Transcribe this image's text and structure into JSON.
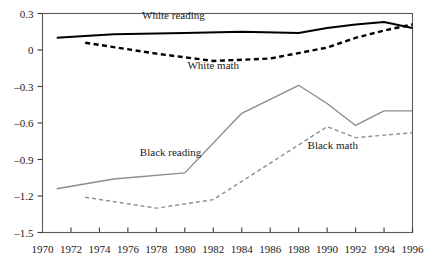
{
  "chart_data": {
    "type": "line",
    "title": "",
    "xlabel": "",
    "ylabel": "",
    "xlim": [
      1970,
      1996
    ],
    "ylim": [
      -1.5,
      0.3
    ],
    "grid": false,
    "legend_position": "inline-annotations",
    "x_ticks": [
      1970,
      1972,
      1974,
      1976,
      1978,
      1980,
      1982,
      1984,
      1986,
      1988,
      1990,
      1992,
      1994,
      1996
    ],
    "x_tick_labels": [
      "1970",
      "1972",
      "1974",
      "1976",
      "1978",
      "1980",
      "1982",
      "1984",
      "1986",
      "1988",
      "1990",
      "1992",
      "1994",
      "1996"
    ],
    "y_ticks": [
      0.3,
      0,
      -0.3,
      -0.6,
      -0.9,
      -1.2,
      -1.5
    ],
    "y_tick_labels": [
      "0.3",
      "0",
      "–0.3",
      "–0.6",
      "–0.9",
      "–1.2",
      "–1.5"
    ],
    "series": [
      {
        "name": "White reading",
        "style": "solid",
        "color": "#000000",
        "width": 2,
        "label_x": 1979.2,
        "label_y": 0.255,
        "x": [
          1971,
          1975,
          1980,
          1984,
          1988,
          1990,
          1992,
          1994,
          1996
        ],
        "values": [
          0.1,
          0.13,
          0.14,
          0.15,
          0.14,
          0.18,
          0.21,
          0.23,
          0.18
        ]
      },
      {
        "name": "White math",
        "style": "dashed",
        "color": "#000000",
        "width": 2.4,
        "label_x": 1982.0,
        "label_y": -0.155,
        "x": [
          1973,
          1978,
          1982,
          1986,
          1990,
          1992,
          1994,
          1996
        ],
        "values": [
          0.06,
          -0.03,
          -0.09,
          -0.07,
          0.02,
          0.1,
          0.16,
          0.21
        ]
      },
      {
        "name": "Black reading",
        "style": "solid",
        "color": "#8c8c8c",
        "width": 1.4,
        "label_x": 1979.0,
        "label_y": -0.87,
        "x": [
          1971,
          1975,
          1980,
          1984,
          1988,
          1990,
          1992,
          1994,
          1996
        ],
        "values": [
          -1.14,
          -1.06,
          -1.01,
          -0.52,
          -0.29,
          -0.44,
          -0.62,
          -0.5,
          -0.5
        ]
      },
      {
        "name": "Black math",
        "style": "dashed",
        "color": "#8c8c8c",
        "width": 1.4,
        "label_x": 1990.4,
        "label_y": -0.81,
        "x": [
          1973,
          1978,
          1982,
          1986,
          1990,
          1992,
          1994,
          1996
        ],
        "values": [
          -1.21,
          -1.3,
          -1.23,
          -0.93,
          -0.63,
          -0.72,
          -0.7,
          -0.68
        ]
      }
    ]
  }
}
